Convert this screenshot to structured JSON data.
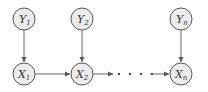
{
  "diagram": {
    "type": "graphical-model",
    "nodes": [
      {
        "id": "Y1",
        "base": "Y",
        "sub": "1",
        "cx": 24,
        "cy": 19
      },
      {
        "id": "Y2",
        "base": "Y",
        "sub": "2",
        "cx": 82,
        "cy": 19
      },
      {
        "id": "Yn",
        "base": "Y",
        "sub": "n",
        "cx": 181,
        "cy": 19
      },
      {
        "id": "X1",
        "base": "X",
        "sub": "1",
        "cx": 24,
        "cy": 74
      },
      {
        "id": "X2",
        "base": "X",
        "sub": "2",
        "cx": 82,
        "cy": 74
      },
      {
        "id": "Xn",
        "base": "X",
        "sub": "n",
        "cx": 181,
        "cy": 74
      }
    ],
    "edges": [
      {
        "from": "Y1",
        "to": "X1"
      },
      {
        "from": "Y2",
        "to": "X2"
      },
      {
        "from": "Yn",
        "to": "Xn"
      },
      {
        "from": "X1",
        "to": "X2"
      },
      {
        "from": "X2",
        "to": "ellipsis"
      },
      {
        "from": "ellipsis",
        "to": "Xn"
      }
    ],
    "ellipsis": "· · · ·"
  }
}
